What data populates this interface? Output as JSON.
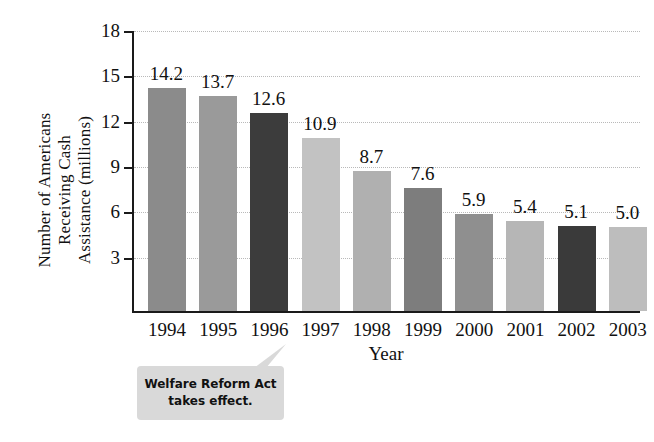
{
  "chart_data": {
    "type": "bar",
    "title": "",
    "subtitle": "",
    "xlabel": "Year",
    "ylabel": "Number of Americans Receiving Cash Assistance (millions)",
    "ylabel_lines": [
      "Number of Americans",
      "Receiving Cash",
      "Assistance (millions)"
    ],
    "categories": [
      "1994",
      "1995",
      "1996",
      "1997",
      "1998",
      "1999",
      "2000",
      "2001",
      "2002",
      "2003"
    ],
    "values": [
      14.2,
      13.7,
      12.6,
      10.9,
      8.7,
      7.6,
      5.9,
      5.4,
      5.1,
      5.0
    ],
    "value_labels": [
      "14.2",
      "13.7",
      "12.6",
      "10.9",
      "8.7",
      "7.6",
      "5.9",
      "5.4",
      "5.1",
      "5.0"
    ],
    "bar_colors": [
      "#8b8b8b",
      "#9a9a9a",
      "#3c3c3c",
      "#c2c2c2",
      "#b0b0b0",
      "#7d7d7d",
      "#8f8f8f",
      "#b6b6b6",
      "#3a3a3a",
      "#bdbdbd"
    ],
    "ylim": [
      0,
      18
    ],
    "yticks": [
      18,
      15,
      12,
      9,
      6,
      3
    ],
    "ytick_labels": [
      "18",
      "15",
      "12",
      "9",
      "6",
      "3"
    ],
    "grid": true,
    "grid_color": "#b9b9b9",
    "legend": "none",
    "axis_color": "#1a1a1a",
    "background": "#ffffff",
    "annotations": [
      {
        "id": "welfare-reform-callout",
        "lines": [
          "Welfare Reform Act",
          "takes effect."
        ],
        "text": "Welfare Reform Act takes effect.",
        "points_at": "1996",
        "fill": "#d9d9d9"
      }
    ]
  }
}
